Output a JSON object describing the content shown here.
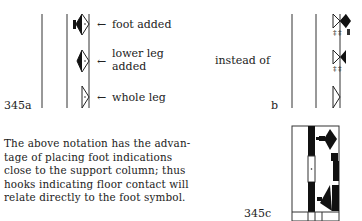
{
  "figure_a": {
    "label": "345a",
    "annotations": [
      {
        "arrow": "←",
        "text": "foot added"
      },
      {
        "arrow": "←",
        "text_line1": "lower leg",
        "text_line2": "added"
      },
      {
        "arrow": "←",
        "text": "whole leg"
      }
    ]
  },
  "figure_b": {
    "label": "b",
    "comparison_text": "instead of"
  },
  "figure_c": {
    "label": "345c"
  },
  "paragraph": {
    "lines": [
      "The above notation has the advan-",
      "tage of placing foot indications",
      "close to the support column; thus",
      "hooks indicating floor contact will",
      "relate directly to the foot symbol."
    ]
  }
}
